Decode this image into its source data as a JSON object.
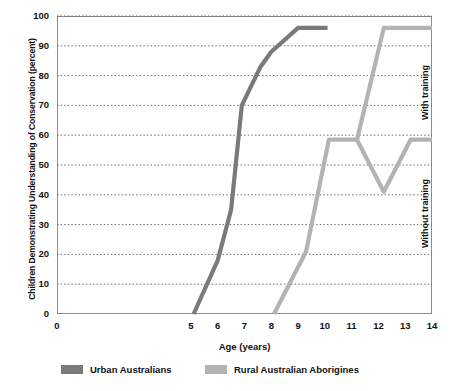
{
  "chart_data": {
    "type": "line",
    "title": "",
    "xlabel": "Age (years)",
    "ylabel": "Children Demonstrating Understanding of Conservation (percent)",
    "xlim": [
      0,
      14
    ],
    "ylim": [
      0,
      100
    ],
    "xticks": [
      "0",
      "1",
      "2",
      "3",
      "4",
      "5",
      "6",
      "7",
      "8",
      "9",
      "10",
      "11",
      "12",
      "13",
      "14"
    ],
    "xticks_shown": [
      "0",
      "5",
      "6",
      "7",
      "8",
      "9",
      "10",
      "11",
      "12",
      "13",
      "14"
    ],
    "yticks": [
      "0",
      "10",
      "20",
      "30",
      "40",
      "50",
      "60",
      "70",
      "80",
      "90",
      "100"
    ],
    "grid": "horizontal-dotted",
    "legend_position": "below",
    "series": [
      {
        "name": "Urban Australians",
        "color": "#7a7a7a",
        "points": [
          {
            "x": 5.1,
            "y": 0
          },
          {
            "x": 6.0,
            "y": 18
          },
          {
            "x": 6.5,
            "y": 35
          },
          {
            "x": 6.9,
            "y": 70
          },
          {
            "x": 7.6,
            "y": 83
          },
          {
            "x": 8.0,
            "y": 88
          },
          {
            "x": 9.0,
            "y": 96
          },
          {
            "x": 10.1,
            "y": 96
          }
        ]
      },
      {
        "name": "Rural Australian Aborigines",
        "color": "#b3b3b3",
        "points": [
          {
            "x": 8.1,
            "y": 0
          },
          {
            "x": 9.3,
            "y": 21
          },
          {
            "x": 10.15,
            "y": 58.5
          },
          {
            "x": 11.2,
            "y": 58.5
          }
        ],
        "branches": [
          {
            "label": "With training",
            "points": [
              {
                "x": 11.2,
                "y": 58.5
              },
              {
                "x": 12.2,
                "y": 96
              },
              {
                "x": 14.0,
                "y": 96
              }
            ]
          },
          {
            "label": "Without training",
            "points": [
              {
                "x": 11.2,
                "y": 58.5
              },
              {
                "x": 12.2,
                "y": 41
              },
              {
                "x": 13.2,
                "y": 58.5
              },
              {
                "x": 14.0,
                "y": 58.5
              }
            ]
          }
        ]
      }
    ],
    "annotations": [
      {
        "name": "with-training",
        "text": "With training"
      },
      {
        "name": "without-training",
        "text": "Without training"
      }
    ]
  },
  "legend": {
    "items": [
      {
        "label": "Urban Australians",
        "color": "#7a7a7a"
      },
      {
        "label": "Rural Australian Aborigines",
        "color": "#b3b3b3"
      }
    ]
  },
  "colors": {
    "urban": "#7a7a7a",
    "rural": "#b3b3b3",
    "frame": "#8c8c8c",
    "grid": "#555555",
    "text": "#111111",
    "background": "#ffffff"
  }
}
